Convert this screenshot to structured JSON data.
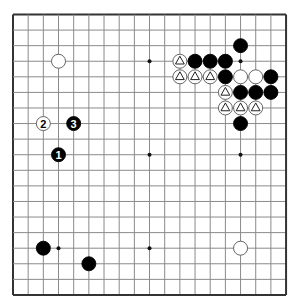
{
  "board": {
    "size": 19,
    "origin": {
      "x": 13,
      "y": 14.5
    },
    "spacing": {
      "x": 15.17,
      "y": 15.58
    },
    "line_color": "#8a8a8a",
    "border_color": "#333333",
    "background": "#ffffff",
    "stone_radius": 7,
    "star_points": [
      [
        3,
        3
      ],
      [
        9,
        3
      ],
      [
        15,
        3
      ],
      [
        3,
        9
      ],
      [
        9,
        9
      ],
      [
        15,
        9
      ],
      [
        3,
        15
      ],
      [
        9,
        15
      ],
      [
        15,
        15
      ]
    ]
  },
  "stones": [
    {
      "color": "white",
      "col": 3,
      "row": 3,
      "label": ""
    },
    {
      "color": "white",
      "col": 2,
      "row": 7,
      "label": "2"
    },
    {
      "color": "black",
      "col": 4,
      "row": 7,
      "label": "3"
    },
    {
      "color": "black",
      "col": 3,
      "row": 9,
      "label": "1"
    },
    {
      "color": "black",
      "col": 15,
      "row": 2,
      "label": ""
    },
    {
      "color": "white",
      "col": 11,
      "row": 3,
      "label": "",
      "marker": "triangle"
    },
    {
      "color": "black",
      "col": 12,
      "row": 3,
      "label": ""
    },
    {
      "color": "black",
      "col": 13,
      "row": 3,
      "label": ""
    },
    {
      "color": "black",
      "col": 14,
      "row": 3,
      "label": ""
    },
    {
      "color": "white",
      "col": 11,
      "row": 4,
      "label": "",
      "marker": "triangle"
    },
    {
      "color": "white",
      "col": 12,
      "row": 4,
      "label": "",
      "marker": "triangle"
    },
    {
      "color": "white",
      "col": 13,
      "row": 4,
      "label": "",
      "marker": "triangle"
    },
    {
      "color": "black",
      "col": 14,
      "row": 4,
      "label": ""
    },
    {
      "color": "white",
      "col": 15,
      "row": 4,
      "label": ""
    },
    {
      "color": "white",
      "col": 16,
      "row": 4,
      "label": ""
    },
    {
      "color": "black",
      "col": 17,
      "row": 4,
      "label": ""
    },
    {
      "color": "white",
      "col": 14,
      "row": 5,
      "label": "",
      "marker": "triangle"
    },
    {
      "color": "black",
      "col": 15,
      "row": 5,
      "label": ""
    },
    {
      "color": "black",
      "col": 16,
      "row": 5,
      "label": ""
    },
    {
      "color": "black",
      "col": 17,
      "row": 5,
      "label": ""
    },
    {
      "color": "white",
      "col": 14,
      "row": 6,
      "label": "",
      "marker": "triangle"
    },
    {
      "color": "white",
      "col": 15,
      "row": 6,
      "label": "",
      "marker": "triangle"
    },
    {
      "color": "white",
      "col": 16,
      "row": 6,
      "label": "",
      "marker": "triangle"
    },
    {
      "color": "black",
      "col": 15,
      "row": 7,
      "label": ""
    },
    {
      "color": "black",
      "col": 2,
      "row": 15,
      "label": ""
    },
    {
      "color": "black",
      "col": 5,
      "row": 16,
      "label": ""
    },
    {
      "color": "white",
      "col": 15,
      "row": 15,
      "label": ""
    }
  ]
}
